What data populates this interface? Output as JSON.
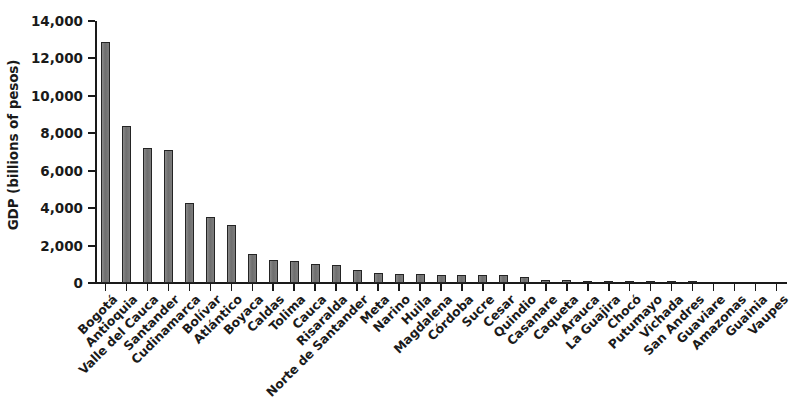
{
  "chart_data": {
    "type": "bar",
    "title": "",
    "subtitle": "",
    "xlabel": "",
    "ylabel": "GDP (billions of pesos)",
    "ylim": [
      0,
      14000
    ],
    "ytick_labels": [
      "0",
      "2,000",
      "4,000",
      "6,000",
      "8,000",
      "10,000",
      "12,000",
      "14,000"
    ],
    "ytick_values": [
      0,
      2000,
      4000,
      6000,
      8000,
      10000,
      12000,
      14000
    ],
    "grid": false,
    "legend": null,
    "bar_color": "#737373",
    "bar_edge_color": "#242424",
    "categories": [
      "Bogotá",
      "Antioquia",
      "Valle del Cauca",
      "Santander",
      "Cudinamarca",
      "Bolívar",
      "Atlántico",
      "Boyaca",
      "Caldas",
      "Tolima",
      "Cauca",
      "Risaralda",
      "Norte de Santander",
      "Meta",
      "Narino",
      "Huila",
      "Magdalena",
      "Córdoba",
      "Sucre",
      "Cesar",
      "Quindio",
      "Casanare",
      "Caqueta",
      "Arauca",
      "La Guajira",
      "Chocó",
      "Putumayo",
      "Vichada",
      "San Andres",
      "Guaviare",
      "Amazonas",
      "Guainia",
      "Vaupes"
    ],
    "values": [
      12900,
      8400,
      7200,
      7100,
      4300,
      3550,
      3100,
      1550,
      1250,
      1150,
      1000,
      950,
      720,
      520,
      500,
      470,
      450,
      440,
      430,
      420,
      300,
      180,
      150,
      120,
      110,
      60,
      50,
      40,
      30,
      20,
      15,
      10,
      5
    ]
  }
}
